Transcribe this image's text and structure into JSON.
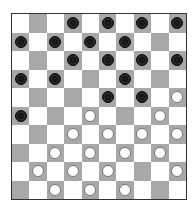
{
  "game": "checkers-10x10",
  "colors": {
    "light_square": "#ffffff",
    "dark_square": "#a8a8a8",
    "black_piece": "#1e1e1e",
    "white_piece": "#ffffff",
    "border": "#333333"
  },
  "board": [
    [
      ".",
      "-",
      ".",
      "b",
      ".",
      "b",
      ".",
      "b",
      ".",
      "b"
    ],
    [
      "b",
      ".",
      "b",
      ".",
      "b",
      ".",
      "b",
      ".",
      "-",
      "."
    ],
    [
      ".",
      "-",
      ".",
      "b",
      ".",
      "b",
      ".",
      "b",
      ".",
      "b"
    ],
    [
      "b",
      ".",
      "b",
      ".",
      "-",
      ".",
      "b",
      ".",
      "-",
      "."
    ],
    [
      ".",
      "-",
      ".",
      "-",
      ".",
      "b",
      ".",
      "b",
      ".",
      "w"
    ],
    [
      "b",
      ".",
      "-",
      ".",
      "w",
      ".",
      "-",
      ".",
      "w",
      "."
    ],
    [
      ".",
      "-",
      ".",
      "w",
      ".",
      "w",
      ".",
      "w",
      ".",
      "w"
    ],
    [
      "-",
      ".",
      "w",
      ".",
      "w",
      ".",
      "w",
      ".",
      "w",
      "."
    ],
    [
      ".",
      "w",
      ".",
      "w",
      ".",
      "w",
      ".",
      "-",
      ".",
      "w"
    ],
    [
      "-",
      ".",
      "w",
      ".",
      "w",
      ".",
      "w",
      ".",
      "-",
      "."
    ]
  ],
  "legend": {
    "b": "black piece",
    "w": "white piece",
    "-": "empty dark square",
    ".": "light square"
  }
}
